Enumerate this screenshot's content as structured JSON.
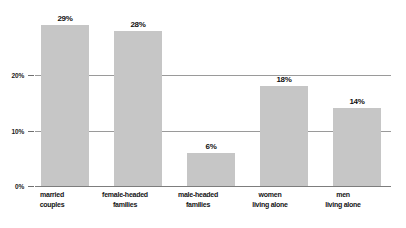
{
  "chart_data": {
    "type": "bar",
    "title": "",
    "subtitle": "",
    "xlabel": "",
    "ylabel": "",
    "categories": [
      "married couples",
      "female-headed families",
      "male-headed families",
      "women living alone",
      "men living alone"
    ],
    "category_lines": [
      [
        "married",
        "couples"
      ],
      [
        "female-headed",
        "families"
      ],
      [
        "male-headed",
        "families"
      ],
      [
        "women",
        "living alone"
      ],
      [
        "men",
        "living alone"
      ]
    ],
    "values": [
      29,
      28,
      6,
      18,
      14
    ],
    "value_labels": [
      "29%",
      "28%",
      "6%",
      "18%",
      "14%"
    ],
    "ylim": [
      0,
      31
    ],
    "yticks": [
      0,
      10,
      20
    ],
    "ytick_labels": [
      "0%",
      "10%",
      "20%"
    ],
    "grid": true,
    "legend": false,
    "legend_position": "none",
    "colors": {
      "bar_fill": "#c6c6c6",
      "gridline": "#9a9a9a",
      "baseline": "#7d7d7d",
      "text": "#141414",
      "background": "#ffffff"
    }
  }
}
